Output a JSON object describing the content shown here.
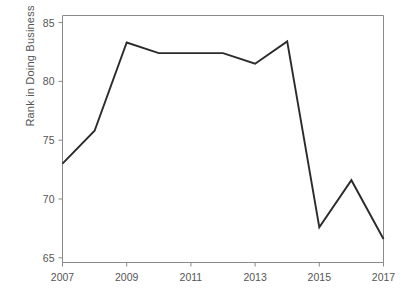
{
  "chart_data": {
    "type": "line",
    "title": "",
    "xlabel": "",
    "ylabel": "Rank in Doing Business",
    "x": [
      2007,
      2008,
      2009,
      2010,
      2011,
      2012,
      2013,
      2014,
      2015,
      2016,
      2017
    ],
    "values": [
      73.0,
      75.8,
      83.3,
      82.4,
      82.4,
      82.4,
      81.5,
      83.4,
      67.6,
      71.6,
      66.6
    ],
    "series": [
      {
        "name": "Rank in Doing Business",
        "values": [
          73.0,
          75.8,
          83.3,
          82.4,
          82.4,
          82.4,
          81.5,
          83.4,
          67.6,
          71.6,
          66.6
        ]
      }
    ],
    "xlim": [
      2007,
      2017
    ],
    "ylim": [
      64.6,
      85.6
    ],
    "xticks": [
      2007,
      2009,
      2011,
      2013,
      2015,
      2017
    ],
    "xtick_labels": [
      "2007",
      "2009",
      "2011",
      "2013",
      "2015",
      "2017"
    ],
    "yticks": [
      65,
      70,
      75,
      80,
      85
    ],
    "ytick_labels": [
      "65",
      "70",
      "75",
      "80",
      "85"
    ],
    "grid": false,
    "legend": false,
    "legend_position": "none",
    "line_color": "#2b2b2b",
    "axis_color": "#8a8a8a",
    "background_color": "#ffffff"
  }
}
